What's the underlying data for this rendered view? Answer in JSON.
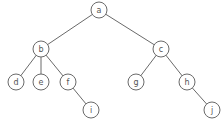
{
  "diagram": {
    "type": "tree",
    "node_radius": 8,
    "nodes": [
      {
        "id": "a",
        "label": "a",
        "x": 99,
        "y": 10
      },
      {
        "id": "b",
        "label": "b",
        "x": 41,
        "y": 49
      },
      {
        "id": "c",
        "label": "c",
        "x": 161,
        "y": 49
      },
      {
        "id": "d",
        "label": "d",
        "x": 16,
        "y": 82
      },
      {
        "id": "e",
        "label": "e",
        "x": 41,
        "y": 82
      },
      {
        "id": "f",
        "label": "f",
        "x": 68,
        "y": 82
      },
      {
        "id": "g",
        "label": "g",
        "x": 136,
        "y": 82
      },
      {
        "id": "h",
        "label": "h",
        "x": 187,
        "y": 82
      },
      {
        "id": "i",
        "label": "i",
        "x": 91,
        "y": 110
      },
      {
        "id": "j",
        "label": "j",
        "x": 212,
        "y": 110
      }
    ],
    "edges": [
      {
        "from": "a",
        "to": "b"
      },
      {
        "from": "a",
        "to": "c"
      },
      {
        "from": "b",
        "to": "d"
      },
      {
        "from": "b",
        "to": "e"
      },
      {
        "from": "b",
        "to": "f"
      },
      {
        "from": "f",
        "to": "i"
      },
      {
        "from": "c",
        "to": "g"
      },
      {
        "from": "c",
        "to": "h"
      },
      {
        "from": "h",
        "to": "j"
      }
    ]
  }
}
